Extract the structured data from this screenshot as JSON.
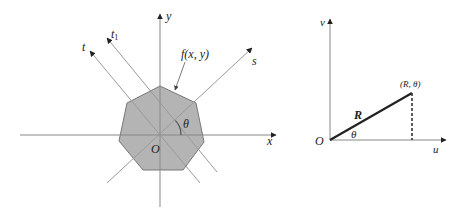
{
  "left_diagram": {
    "labels": {
      "y_axis": "y",
      "x_axis": "x",
      "origin": "O",
      "t_axis": "t",
      "t1_axis_base": "t",
      "t1_axis_sub": "1",
      "s_axis": "s",
      "function": "f(x, y)",
      "angle": "θ"
    },
    "colors": {
      "shape_fill": "#b4b4b4",
      "shape_stroke": "#777777",
      "axis": "#888888",
      "rotated_axes": "#999999"
    }
  },
  "right_diagram": {
    "labels": {
      "v_axis": "v",
      "u_axis": "u",
      "origin": "O",
      "radius": "R",
      "angle": "θ",
      "point": "(R, θ)"
    },
    "colors": {
      "radius_line": "#222222",
      "axis": "#888888",
      "dashed": "#333333"
    }
  }
}
